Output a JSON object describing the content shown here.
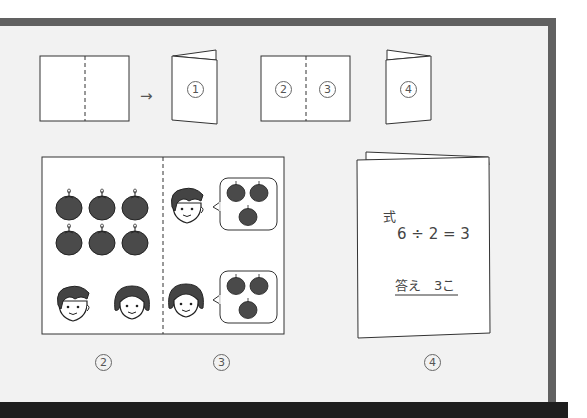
{
  "diagram": {
    "steps": {
      "arrow": "→",
      "booklet_front_label": "1",
      "spread_left_label": "2",
      "spread_right_label": "3",
      "booklet_back_label": "4"
    },
    "illustration": {
      "left_page": {
        "fruit_count": 6,
        "children": [
          "boy",
          "girl"
        ]
      },
      "right_page": {
        "rows": [
          {
            "child": "boy",
            "fruit_in_bubble": 3
          },
          {
            "child": "girl",
            "fruit_in_bubble": 3
          }
        ]
      }
    },
    "answer_card": {
      "shiki_label": "式",
      "equation": "6 ÷ 2 = 3",
      "answer": "答え　3こ"
    },
    "page_labels": {
      "p2": "2",
      "p3": "3",
      "p4": "4"
    }
  },
  "colors": {
    "frame": "#616161",
    "background": "#f2f2f2",
    "fruit": "#4a4a4a",
    "bottom_bar": "#1e1e1e"
  }
}
